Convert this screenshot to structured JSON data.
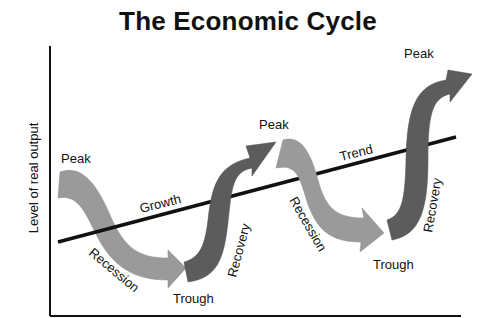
{
  "title": "The Economic Cycle",
  "y_axis_label": "Level of real output",
  "trend_line": {
    "label": "Trend",
    "color": "#111111"
  },
  "labels": {
    "peak_1": "Peak",
    "peak_2": "Peak",
    "peak_3": "Peak",
    "trough_1": "Trough",
    "trough_2": "Trough",
    "growth": "Growth",
    "trend": "Trend",
    "recession_1": "Recession",
    "recession_2": "Recession",
    "recovery_1": "Recovery",
    "recovery_2": "Recovery"
  },
  "colors": {
    "recession_arrow": "#9a9a9a",
    "recovery_arrow": "#5c5c5c",
    "axis": "#111111"
  },
  "phases": [
    {
      "phase": "Recession",
      "from": "Peak",
      "to": "Trough"
    },
    {
      "phase": "Recovery",
      "from": "Trough",
      "to": "Peak"
    },
    {
      "phase": "Recession",
      "from": "Peak",
      "to": "Trough"
    },
    {
      "phase": "Recovery",
      "from": "Trough",
      "to": "Peak"
    }
  ]
}
